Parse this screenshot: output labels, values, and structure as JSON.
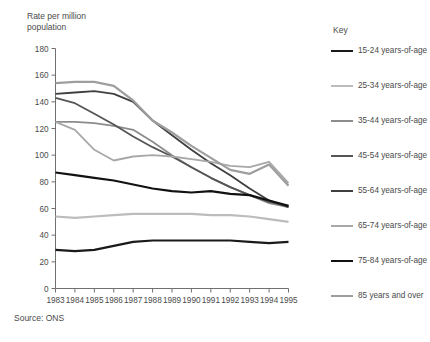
{
  "axis_title": "Rate per million\npopulation",
  "source": "Source:  ONS",
  "key_title": "Key",
  "chart_data": {
    "type": "line",
    "title": "",
    "subtitle": "",
    "xlabel": "",
    "ylabel": "Rate per million population",
    "ylim": [
      0,
      180
    ],
    "ytick_step": 20,
    "yticks": [
      0,
      20,
      40,
      60,
      80,
      100,
      120,
      140,
      160,
      180
    ],
    "grid": false,
    "legend_position": "right",
    "legend_title": "Key",
    "source": "Source:  ONS",
    "x": [
      1983,
      1984,
      1985,
      1986,
      1987,
      1988,
      1989,
      1990,
      1991,
      1992,
      1993,
      1994,
      1995
    ],
    "categories": [
      "1983",
      "1984",
      "1985",
      "1986",
      "1987",
      "1988",
      "1989",
      "1990",
      "1991",
      "1992",
      "1993",
      "1994",
      "1995"
    ],
    "series": [
      {
        "name": "15-24 years-of-age",
        "color": "#1a1a1a",
        "width": 2.2,
        "values": [
          29,
          28,
          29,
          32,
          35,
          36,
          36,
          36,
          36,
          36,
          35,
          34,
          35
        ]
      },
      {
        "name": "25-34 years-of-age",
        "color": "#bcbcbc",
        "width": 2.2,
        "values": [
          54,
          53,
          54,
          55,
          56,
          56,
          56,
          56,
          55,
          55,
          54,
          52,
          50
        ]
      },
      {
        "name": "35-44 years-of-age",
        "color": "#8c8c8c",
        "width": 1.8,
        "values": [
          125,
          125,
          124,
          122,
          119,
          110,
          100,
          91,
          83,
          76,
          70,
          64,
          61
        ]
      },
      {
        "name": "45-54 years-of-age",
        "color": "#555555",
        "width": 1.8,
        "values": [
          143,
          139,
          131,
          123,
          114,
          106,
          99,
          91,
          83,
          76,
          70,
          65,
          62
        ]
      },
      {
        "name": "55-64 years-of-age",
        "color": "#3f3f3f",
        "width": 1.8,
        "values": [
          146,
          147,
          148,
          146,
          140,
          126,
          115,
          104,
          94,
          85,
          75,
          66,
          61
        ]
      },
      {
        "name": "65-74 years-of-age",
        "color": "#a8a8a8",
        "width": 1.8,
        "values": [
          125,
          119,
          104,
          96,
          99,
          100,
          99,
          97,
          95,
          92,
          91,
          95,
          79
        ]
      },
      {
        "name": "75-84 years-of-age",
        "color": "#111111",
        "width": 2.2,
        "values": [
          87,
          85,
          83,
          81,
          78,
          75,
          73,
          72,
          73,
          71,
          70,
          66,
          62
        ]
      },
      {
        "name": "85 years and over",
        "color": "#9e9e9e",
        "width": 2.2,
        "values": [
          154,
          155,
          155,
          152,
          141,
          126,
          117,
          107,
          98,
          89,
          86,
          93,
          77
        ]
      }
    ]
  }
}
